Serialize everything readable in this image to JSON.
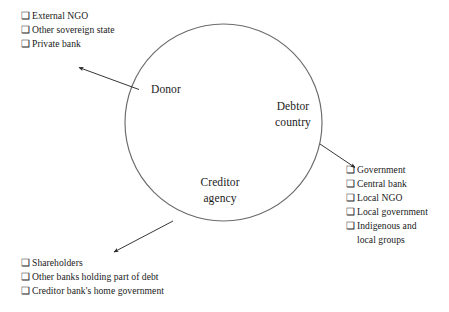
{
  "figure": {
    "type": "relationship-diagram",
    "bullet_glyph": "❑",
    "stroke_color": "#555555",
    "text_color": "#1a1a1a",
    "background": "#ffffff"
  },
  "circle": {
    "roles": [
      {
        "key": "donor",
        "label": "Donor"
      },
      {
        "key": "debtor",
        "label": "Debtor\ncountry"
      },
      {
        "key": "creditor",
        "label": "Creditor\nagency"
      }
    ]
  },
  "lists": {
    "donor_actors": {
      "items": [
        "External NGO",
        "Other sovereign state",
        "Private bank"
      ]
    },
    "debtor_actors": {
      "items": [
        "Government",
        "Central bank",
        "Local NGO",
        "Local government",
        "Indigenous and\nlocal groups"
      ]
    },
    "creditor_actors": {
      "items": [
        "Shareholders",
        "Other banks holding part of debt",
        "Creditor bank's home government"
      ]
    }
  },
  "arrows": [
    {
      "key": "donor-arrow",
      "from": "donor-sector",
      "to": "donor_actors",
      "direction": "up-left"
    },
    {
      "key": "debtor-arrow",
      "from": "debtor-sector",
      "to": "debtor_actors",
      "direction": "down-right"
    },
    {
      "key": "creditor-arrow",
      "from": "creditor-sector",
      "to": "creditor_actors",
      "direction": "down-left"
    }
  ]
}
